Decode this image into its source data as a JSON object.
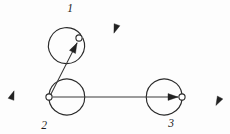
{
  "diagram": {
    "type": "directed-graph",
    "background_color": "#fdfdfd",
    "stroke_color": "#2a2a2a",
    "label_color": "#1c1c1c",
    "nodes": [
      {
        "id": "1",
        "label": "1",
        "dot_x": 79,
        "dot_y": 38,
        "dot_r": 3.1,
        "label_x": 70,
        "label_y": 12,
        "loop_cx": 97,
        "loop_cy": 27,
        "loop_r": 18,
        "loop_arrow_angle_deg": 20,
        "self_loop": true
      },
      {
        "id": "2",
        "label": "2",
        "dot_x": 49,
        "dot_y": 97,
        "dot_r": 3.1,
        "label_x": 44,
        "label_y": 129,
        "loop_cx": 31,
        "loop_cy": 97,
        "loop_r": 18,
        "loop_arrow_angle_deg": 200,
        "self_loop": true
      },
      {
        "id": "3",
        "label": "3",
        "dot_x": 182,
        "dot_y": 97,
        "dot_r": 3.1,
        "label_x": 171,
        "label_y": 127,
        "loop_cx": 200,
        "loop_cy": 97,
        "loop_r": 18,
        "loop_arrow_angle_deg": 28,
        "self_loop": true
      }
    ],
    "edges": [
      {
        "id": "edge-2-to-1",
        "from": "2",
        "to": "1",
        "x1": 51,
        "y1": 94,
        "x2": 77,
        "y2": 43,
        "arrow": "end",
        "label": ""
      },
      {
        "id": "edge-2-to-3",
        "from": "2",
        "to": "3",
        "x1": 53,
        "y1": 97,
        "x2": 178,
        "y2": 97,
        "arrow": "end",
        "label": ""
      }
    ]
  }
}
